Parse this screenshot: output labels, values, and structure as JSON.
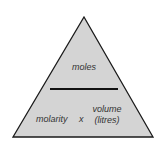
{
  "diagram": {
    "type": "formula-triangle",
    "top_label": "moles",
    "bottom_left_label": "molarity",
    "operator": "x",
    "bottom_right_label_line1": "volume",
    "bottom_right_label_line2": "(litres)",
    "colors": {
      "fill": "#d4d4d4",
      "stroke": "#1a1a1a",
      "text": "#333333",
      "background": "#ffffff"
    }
  }
}
